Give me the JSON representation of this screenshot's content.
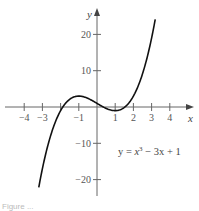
{
  "chart_data": {
    "type": "line",
    "title": "",
    "equation": "y = x^3 - 3x + 1",
    "equation_parts": {
      "lhs": "y = ",
      "x": "x",
      "exp": "3",
      "rest": " − 3x + 1"
    },
    "xlabel": "x",
    "ylabel": "y",
    "xlim": [
      -4.5,
      5
    ],
    "ylim": [
      -25,
      25
    ],
    "x_ticks": [
      -4,
      -3,
      -2,
      -1,
      1,
      2,
      3,
      4
    ],
    "x_tick_labels": [
      "−4",
      "−3",
      "",
      "−1",
      "1",
      "2",
      "3",
      "4"
    ],
    "y_ticks": [
      20,
      10,
      -10,
      -20
    ],
    "y_tick_labels": [
      "20",
      "10",
      "−10",
      "−20"
    ],
    "grid": false,
    "legend": null,
    "series": [
      {
        "name": "y = x^3 - 3x + 1",
        "x": [
          -3.2,
          -3,
          -2.5,
          -2,
          -1.5,
          -1,
          -0.5,
          0,
          0.5,
          1,
          1.5,
          2,
          2.5,
          3,
          3.2
        ],
        "y": [
          -22.2,
          -17,
          -7.1,
          -1,
          2.1,
          3,
          2.4,
          1,
          -0.4,
          -1,
          -0.1,
          3,
          9.1,
          19,
          24.2
        ]
      }
    ],
    "caption": "Figure ..."
  }
}
